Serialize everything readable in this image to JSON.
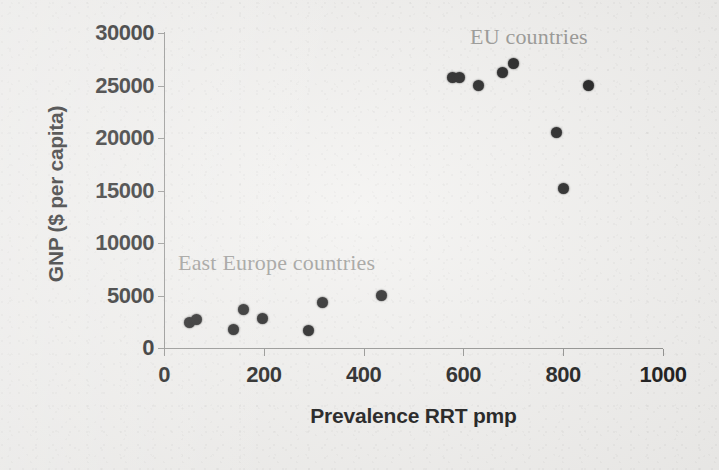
{
  "chart_data": {
    "type": "scatter",
    "title": "",
    "xlabel": "Prevalence RRT pmp",
    "ylabel": "GNP ($ per capita)",
    "xlim": [
      0,
      1000
    ],
    "ylim": [
      0,
      30000
    ],
    "grid": false,
    "legend": "none",
    "xticks": [
      "0",
      "200",
      "400",
      "600",
      "800",
      "1000"
    ],
    "xtick_values": [
      0,
      200,
      400,
      600,
      800,
      1000
    ],
    "yticks": [
      "0",
      "5000",
      "10000",
      "15000",
      "20000",
      "25000",
      "30000"
    ],
    "ytick_values": [
      0,
      5000,
      10000,
      15000,
      20000,
      25000,
      30000
    ],
    "marker": "filled-circle",
    "marker_color": "#111111",
    "series": [
      {
        "name": "East Europe countries",
        "points": [
          {
            "x": 52,
            "y": 2400
          },
          {
            "x": 66,
            "y": 2700
          },
          {
            "x": 140,
            "y": 1800
          },
          {
            "x": 160,
            "y": 3700
          },
          {
            "x": 198,
            "y": 2800
          },
          {
            "x": 290,
            "y": 1700
          },
          {
            "x": 318,
            "y": 4300
          },
          {
            "x": 435,
            "y": 5000
          }
        ]
      },
      {
        "name": "EU countries",
        "points": [
          {
            "x": 578,
            "y": 25800
          },
          {
            "x": 592,
            "y": 25800
          },
          {
            "x": 630,
            "y": 25000
          },
          {
            "x": 678,
            "y": 26200
          },
          {
            "x": 700,
            "y": 27100
          },
          {
            "x": 786,
            "y": 20500
          },
          {
            "x": 800,
            "y": 15200
          },
          {
            "x": 850,
            "y": 25000
          }
        ]
      }
    ],
    "annotations": [
      {
        "text": "EU countries",
        "x": 820,
        "y": 29000
      },
      {
        "text": "East Europe countries",
        "x": 90,
        "y": 9300
      }
    ]
  },
  "annotations": {
    "eu": "EU countries",
    "east_europe": "East Europe countries"
  },
  "axes": {
    "x_title": "Prevalence RRT pmp",
    "y_title": "GNP ($ per capita)"
  }
}
